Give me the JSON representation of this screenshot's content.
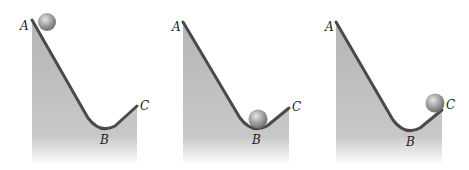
{
  "figure": {
    "colors": {
      "track": "#4a4a4a",
      "fill": "#b9b9b9",
      "ball": "#9a9a9a",
      "label": "#222222"
    },
    "panels": [
      {
        "id": "panel-1",
        "ball_position": "A",
        "labels": {
          "a": "A",
          "b": "B",
          "c": "C"
        }
      },
      {
        "id": "panel-2",
        "ball_position": "B",
        "labels": {
          "a": "A",
          "b": "B",
          "c": "C"
        }
      },
      {
        "id": "panel-3",
        "ball_position": "C",
        "labels": {
          "a": "A",
          "b": "B",
          "c": "C"
        }
      }
    ]
  }
}
